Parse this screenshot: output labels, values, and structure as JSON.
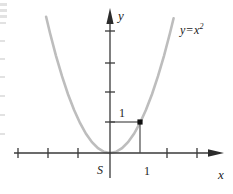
{
  "figure": {
    "kind": "math-graph",
    "background": "#ffffff",
    "axis_color": "#3a3a3a",
    "curve_color": "#bdbdbd",
    "helper_line_color": "#4a4a4a",
    "point_color": "#111111"
  },
  "labels": {
    "y_axis": "y",
    "x_axis": "x",
    "origin": "S",
    "x_tick_one": "1",
    "y_value_one": "1",
    "curve_lhs": "y",
    "curve_eq": "=",
    "curve_base": "x",
    "curve_exponent": "2"
  },
  "chart_data": {
    "type": "line",
    "title": "",
    "subtitle": "",
    "xlabel": "x",
    "ylabel": "y",
    "function": "y = x^2",
    "legend": [
      "y = x²"
    ],
    "legend_position": "upper-right (inline curve label)",
    "grid": false,
    "origin_label": "S",
    "xlim": [
      -3.07,
      4.1
    ],
    "ylim": [
      -1.37,
      4.73
    ],
    "unit_px": 30,
    "origin_px": {
      "x": 110,
      "y": 153
    },
    "x_ticks": [
      -3,
      -2,
      -1,
      1,
      2,
      3
    ],
    "x_tick_labels": [
      "",
      "",
      "",
      "1",
      "",
      ""
    ],
    "x_tick_px": [
      18,
      48,
      78,
      140,
      167,
      197
    ],
    "y_ticks": [
      1,
      2,
      3,
      4
    ],
    "y_tick_labels": [
      "",
      "",
      "",
      ""
    ],
    "y_tick_px": [
      122,
      92,
      63,
      31
    ],
    "annotations": [
      {
        "name": "unit-point",
        "point": [
          1,
          1
        ],
        "point_px": [
          140,
          122
        ],
        "label": "1",
        "label_px": [
          119,
          107
        ],
        "guides": [
          "horizontal from y-axis to point",
          "vertical from point to x-axis"
        ]
      }
    ],
    "series": [
      {
        "name": "y = x²",
        "color": "#bdbdbd",
        "x": [
          -2.13,
          -2.0,
          -1.8,
          -1.6,
          -1.4,
          -1.2,
          -1.0,
          -0.8,
          -0.6,
          -0.4,
          -0.2,
          0.0,
          0.2,
          0.4,
          0.6,
          0.8,
          1.0,
          1.2,
          1.4,
          1.6,
          1.8,
          2.0,
          2.12
        ],
        "values": [
          4.54,
          4.0,
          3.24,
          2.56,
          1.96,
          1.44,
          1.0,
          0.64,
          0.36,
          0.16,
          0.04,
          0.0,
          0.04,
          0.16,
          0.36,
          0.64,
          1.0,
          1.44,
          1.96,
          2.56,
          3.24,
          4.0,
          4.49
        ]
      }
    ]
  }
}
